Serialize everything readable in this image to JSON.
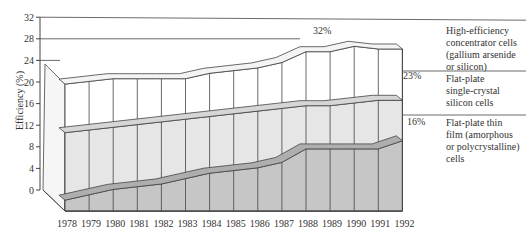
{
  "chart_data": {
    "type": "area",
    "subtype": "3d-stacked-ribbon",
    "title": "",
    "xlabel": "",
    "ylabel": "Efficiency (%)",
    "ylim": [
      0,
      32
    ],
    "yticks": [
      0,
      4,
      8,
      12,
      16,
      20,
      24,
      28,
      32
    ],
    "categories": [
      "1978",
      "1979",
      "1980",
      "1981",
      "1982",
      "1983",
      "1984",
      "1985",
      "1986",
      "1987",
      "1988",
      "1989",
      "1990",
      "1991",
      "1992"
    ],
    "series": [
      {
        "name": "Flat-plate thin film (amorphous or polycrystalline) cells",
        "end_label": "16%",
        "values": [
          2,
          3,
          4,
          4.5,
          5,
          6,
          7,
          7.5,
          8,
          9,
          11.5,
          11.5,
          11.5,
          11.5,
          13
        ],
        "color": "#c6c6c6"
      },
      {
        "name": "Flat-plate single-crystal silicon cells",
        "end_label": "23%",
        "values": [
          14.5,
          15,
          15.5,
          16,
          16.5,
          17,
          17.5,
          18,
          18.5,
          19,
          19.5,
          19.5,
          20,
          20.5,
          20.5
        ],
        "color": "#e6e6e6"
      },
      {
        "name": "High-efficiency concentrator cells (gallium arsenide or silicon)",
        "end_label": "32%",
        "values": [
          23.5,
          24,
          24.5,
          24.5,
          24.5,
          24.5,
          25.5,
          26,
          26.5,
          27.5,
          29.5,
          29.5,
          30.5,
          30,
          30
        ],
        "color": "#ffffff"
      }
    ],
    "grid": false,
    "legend_position": "right"
  },
  "axis": {
    "ylabel": "Efficiency (%)",
    "yticks": [
      "0",
      "4",
      "8",
      "12",
      "16",
      "20",
      "24",
      "28",
      "32"
    ],
    "xticks": [
      "1978",
      "1979",
      "1980",
      "1981",
      "1982",
      "1983",
      "1984",
      "1985",
      "1986",
      "1987",
      "1988",
      "1989",
      "1990",
      "1991",
      "1992"
    ]
  },
  "legend": [
    {
      "pct": "32%",
      "lines": [
        "High-efficiency",
        "concentrator cells",
        "(gallium arsenide",
        "or silicon)"
      ]
    },
    {
      "pct": "23%",
      "lines": [
        "Flat-plate",
        "single-crystal",
        "silicon cells"
      ]
    },
    {
      "pct": "16%",
      "lines": [
        "Flat-plate thin",
        "film (amorphous",
        "or polycrystalline)",
        "cells"
      ]
    }
  ]
}
